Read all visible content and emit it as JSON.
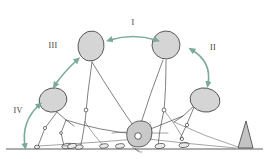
{
  "figure": {
    "background_color": "#ffffff",
    "ink_color": "#4a4a4a",
    "arrow_color": "#7aab97",
    "head_fill": "#d5d5d5",
    "hub_fill": "#c9c9c9",
    "wedge_fill": "#c3c3c3"
  },
  "labels": [
    {
      "id": "phase-1",
      "text": "I",
      "x": 133,
      "y": 25
    },
    {
      "id": "phase-2",
      "text": "II",
      "x": 213,
      "y": 50
    },
    {
      "id": "phase-3",
      "text": "III",
      "x": 53,
      "y": 48
    },
    {
      "id": "phase-4",
      "text": "IV",
      "x": 18,
      "y": 113
    }
  ],
  "arrows": [
    {
      "id": "arrow-phase-1",
      "label": "I",
      "style": "double-headed",
      "orientation": "horizontal",
      "color": "#7aab97",
      "path": "M 110 40 Q 133 33 156 40"
    },
    {
      "id": "arrow-phase-2",
      "label": "II",
      "style": "double-headed",
      "orientation": "curved-descending",
      "color": "#7aab97",
      "path": "M 192 50 Q 210 64 208 82"
    },
    {
      "id": "arrow-phase-3",
      "label": "III",
      "style": "double-headed",
      "orientation": "diagonal",
      "color": "#7aab97",
      "path": "M 55 84 Q 64 72 76 61"
    },
    {
      "id": "arrow-phase-4",
      "label": "IV",
      "style": "double-headed",
      "orientation": "curved-ascending",
      "color": "#7aab97",
      "path": "M 24 145 Q 22 122 39 106"
    }
  ],
  "heads": [
    {
      "id": "head-left",
      "cx": 53,
      "cy": 100,
      "rx": 14,
      "ry": 12,
      "rotate": -14
    },
    {
      "id": "head-upper-left",
      "cx": 91,
      "cy": 46,
      "rx": 13,
      "ry": 15,
      "rotate": 8
    },
    {
      "id": "head-upper-right",
      "cx": 166,
      "cy": 45,
      "rx": 14,
      "ry": 14,
      "rotate": -4
    },
    {
      "id": "head-right",
      "cx": 205,
      "cy": 100,
      "rx": 15,
      "ry": 12,
      "rotate": 10
    }
  ],
  "ground": {
    "y": 149,
    "x1": 6,
    "x2": 263
  },
  "hub": {
    "cx": 139,
    "cy": 136,
    "r": 12
  },
  "wedge": {
    "x": 239,
    "y_base": 149,
    "height": 28,
    "width": 14
  }
}
